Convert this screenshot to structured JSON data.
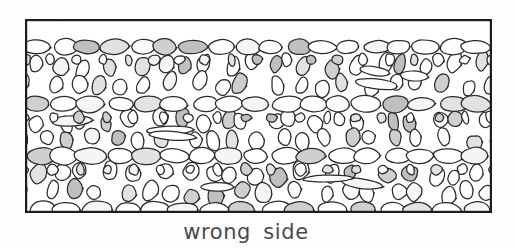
{
  "figure": {
    "kind": "knitting-stitch-swatch-illustration",
    "caption": "wrong side",
    "caption_font_size_px": 21,
    "caption_letter_spacing_px": 0.6,
    "caption_word_spacing_px": 5,
    "caption_color": "#4a4a4a",
    "caption_center_x": 246,
    "caption_baseline_y": 241,
    "background_color": "#fdfdfd"
  },
  "swatch": {
    "label": "reverse-stockinette textured fabric swatch",
    "x": 25,
    "y": 19,
    "width": 467,
    "height": 194,
    "border_color": "#1d1d1d",
    "border_width_px": 2.2,
    "fill_color": "#ffffff",
    "ink_color": "#2b2b2b",
    "stitch_outline_width_px": 1.25,
    "shade_light": "#f5f5f5",
    "shade_mid": "#e2e2e2",
    "shade_dark": "#cfcfcf",
    "shade_darker": "#bfbfbf"
  },
  "stitch_pattern": {
    "description": "Alternating horizontal purl-bump ridges and bands of slanted elongated loop stitches, typical of a knitted fabric seen from the wrong side.",
    "bump_rows": [
      {
        "name": "bump-row-top",
        "center_y": 28,
        "bump_width": 27,
        "bump_height": 15,
        "count": 18
      },
      {
        "name": "bump-row-upper",
        "center_y": 85,
        "bump_width": 29,
        "bump_height": 16,
        "count": 17
      },
      {
        "name": "bump-row-middle",
        "center_y": 137,
        "bump_width": 29,
        "bump_height": 16,
        "count": 17
      },
      {
        "name": "bump-row-lower",
        "center_y": 191,
        "bump_width": 30,
        "bump_height": 17,
        "count": 16
      }
    ],
    "texture_bands": [
      {
        "name": "texture-band-1",
        "top": 36,
        "bottom": 77,
        "columns": 19,
        "slant": 16,
        "loop_width": 13,
        "style": "long-vertical"
      },
      {
        "name": "texture-band-2",
        "top": 93,
        "bottom": 129,
        "columns": 20,
        "slant": -14,
        "loop_width": 13,
        "style": "diagonal"
      },
      {
        "name": "texture-band-3",
        "top": 145,
        "bottom": 183,
        "columns": 19,
        "slant": 19,
        "loop_width": 14,
        "style": "diagonal"
      },
      {
        "name": "texture-band-4",
        "top": 199,
        "bottom": 211,
        "columns": 22,
        "slant": 4,
        "loop_width": 10,
        "style": "short"
      }
    ],
    "shade_probability": 0.42,
    "random_seed": 20437
  }
}
